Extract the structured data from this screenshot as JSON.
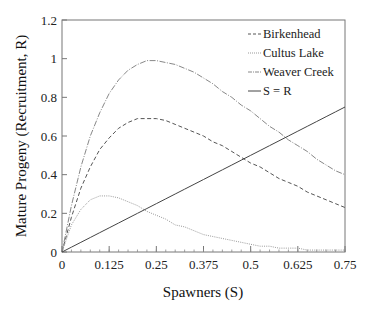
{
  "chart_data": {
    "type": "line",
    "title": "",
    "xlabel": "Spawners (S)",
    "ylabel": "Mature Progeny (Recruitment, R)",
    "xlim": [
      0,
      0.75
    ],
    "ylim": [
      0,
      1.2
    ],
    "x_ticks": [
      0,
      0.125,
      0.25,
      0.375,
      0.5,
      0.625,
      0.75
    ],
    "x_tick_labels": [
      "0",
      "0.125",
      "0.25",
      "0.375",
      "0.5",
      "0.625",
      "0.75"
    ],
    "y_ticks": [
      0,
      0.2,
      0.4,
      0.6,
      0.8,
      1,
      1.2
    ],
    "y_tick_labels": [
      "0",
      "0.2",
      "0.4",
      "0.6",
      "0.8",
      "1",
      "1.2"
    ],
    "grid": false,
    "legend_position": "upper right",
    "x": [
      0,
      0.025,
      0.05,
      0.075,
      0.1,
      0.125,
      0.15,
      0.175,
      0.2,
      0.225,
      0.25,
      0.275,
      0.3,
      0.325,
      0.35,
      0.375,
      0.4,
      0.425,
      0.45,
      0.475,
      0.5,
      0.525,
      0.55,
      0.575,
      0.6,
      0.625,
      0.65,
      0.675,
      0.7,
      0.725,
      0.75
    ],
    "series": [
      {
        "name": "Birkenhead",
        "style": "dashed",
        "color": "#555555",
        "model": "Ricker R = a*S*exp(-b*S), a=8.16, b=4.35",
        "values": [
          0,
          0.18,
          0.33,
          0.44,
          0.53,
          0.59,
          0.64,
          0.67,
          0.69,
          0.69,
          0.69,
          0.68,
          0.66,
          0.64,
          0.62,
          0.6,
          0.57,
          0.55,
          0.52,
          0.49,
          0.46,
          0.44,
          0.41,
          0.38,
          0.36,
          0.34,
          0.31,
          0.29,
          0.27,
          0.25,
          0.23
        ]
      },
      {
        "name": "Cultus Lake",
        "style": "dotted",
        "color": "#999999",
        "model": "Ricker R = a*S*exp(-b*S), a=7.02, b=8.9",
        "values": [
          0,
          0.14,
          0.22,
          0.27,
          0.29,
          0.29,
          0.28,
          0.26,
          0.24,
          0.21,
          0.19,
          0.17,
          0.14,
          0.13,
          0.11,
          0.09,
          0.08,
          0.07,
          0.06,
          0.05,
          0.04,
          0.03,
          0.03,
          0.02,
          0.02,
          0.02,
          0.01,
          0.01,
          0.01,
          0.01,
          0.01
        ]
      },
      {
        "name": "Weaver Creek",
        "style": "dash-dot",
        "color": "#888888",
        "model": "Ricker R = a*S*exp(-b*S), a=10.76, b=4.0",
        "values": [
          0,
          0.24,
          0.44,
          0.6,
          0.72,
          0.82,
          0.89,
          0.94,
          0.97,
          0.99,
          0.99,
          0.98,
          0.97,
          0.95,
          0.93,
          0.9,
          0.87,
          0.83,
          0.8,
          0.76,
          0.73,
          0.69,
          0.65,
          0.62,
          0.58,
          0.55,
          0.52,
          0.48,
          0.45,
          0.42,
          0.4
        ]
      },
      {
        "name": "S = R",
        "style": "solid",
        "color": "#444444",
        "values": [
          0,
          0.025,
          0.05,
          0.075,
          0.1,
          0.125,
          0.15,
          0.175,
          0.2,
          0.225,
          0.25,
          0.275,
          0.3,
          0.325,
          0.35,
          0.375,
          0.4,
          0.425,
          0.45,
          0.475,
          0.5,
          0.525,
          0.55,
          0.575,
          0.6,
          0.625,
          0.65,
          0.675,
          0.7,
          0.725,
          0.75
        ]
      }
    ]
  },
  "legend": {
    "items": [
      {
        "label": "Birkenhead",
        "style": "dashed"
      },
      {
        "label": "Cultus Lake",
        "style": "dotted"
      },
      {
        "label": "Weaver Creek",
        "style": "dash-dot"
      },
      {
        "label": "S = R",
        "style": "solid"
      }
    ]
  }
}
